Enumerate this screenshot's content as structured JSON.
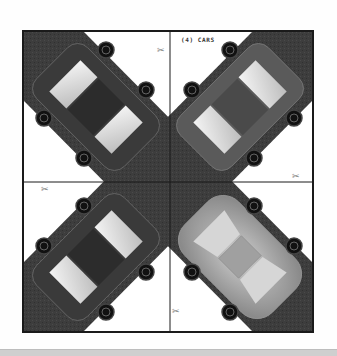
{
  "sheet": {
    "title_label": "(4) CARS",
    "cut_mark_glyph": "✂",
    "colors": {
      "frame_border": "#1a1a1a",
      "car_dark": "#3a3a3a",
      "car_mid": "#5a5a5a",
      "car_light": "#a8a8a8",
      "window": "#e8e8e8",
      "wheel": "#111111",
      "background": "#ffffff",
      "bottom_band": "#cfcfcf"
    }
  },
  "cars": [
    {
      "id": "car-top-left",
      "tone": "dark"
    },
    {
      "id": "car-top-right",
      "tone": "mid"
    },
    {
      "id": "car-bottom-left",
      "tone": "dark"
    },
    {
      "id": "car-bottom-right",
      "tone": "light"
    }
  ],
  "cut_marks": [
    {
      "position": "top-center"
    },
    {
      "position": "left-middle"
    },
    {
      "position": "right-middle"
    },
    {
      "position": "bottom-center"
    }
  ]
}
